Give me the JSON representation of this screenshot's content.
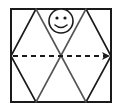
{
  "diagram": {
    "colors": {
      "stroke": "#1a1a1a",
      "inner_stroke": "#555555",
      "background": "#ffffff"
    },
    "frame": {
      "x": 11,
      "y": 9,
      "width": 100,
      "height": 93
    },
    "lattice_lines": [
      {
        "x1": 36,
        "y1": 9,
        "x2": 11,
        "y2": 56
      },
      {
        "x1": 11,
        "y1": 56,
        "x2": 36,
        "y2": 102
      },
      {
        "x1": 86,
        "y1": 9,
        "x2": 111,
        "y2": 56
      },
      {
        "x1": 111,
        "y1": 56,
        "x2": 86,
        "y2": 102
      },
      {
        "x1": 36,
        "y1": 9,
        "x2": 86,
        "y2": 102
      },
      {
        "x1": 86,
        "y1": 9,
        "x2": 36,
        "y2": 102
      }
    ],
    "smiley": {
      "cx": 61,
      "cy": 21,
      "r": 12,
      "eyes": [
        {
          "cx": 57,
          "cy": 18
        },
        {
          "cx": 65,
          "cy": 18
        }
      ]
    },
    "arrow": {
      "x1": 12,
      "y1": 56,
      "x2": 111,
      "y2": 56,
      "style": "dashed",
      "direction": "right"
    }
  }
}
